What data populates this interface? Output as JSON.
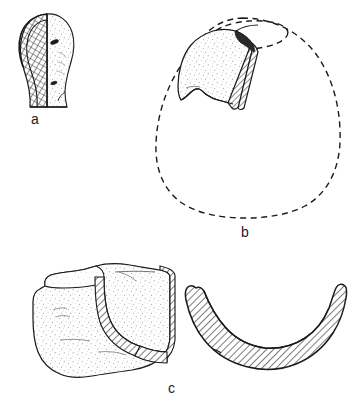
{
  "plate": {
    "title": "Archaeological artefact illustration plate",
    "description": "Ink line drawing plate of three ceramic/stone artefact fragments with sectioned (hatched) profiles, stippled surfaces and dashed reconstruction outlines.",
    "background_color": "#ffffff",
    "ink_color": "#1b1b1b",
    "hatch_color": "#2a2a2a",
    "stipple_color": "#777777"
  },
  "figures": [
    {
      "id": "a",
      "caption": "a",
      "type": "profile-with-section",
      "description": "Small rounded artefact in side view; left half rendered as a cross-hatched section, right half as a stippled outer surface with two small dark perforations.",
      "features": [
        "cross-hatched-section",
        "stippled-surface",
        "two-perforations"
      ],
      "bounds": {
        "x": 18,
        "y": 8,
        "width": 60,
        "height": 100
      }
    },
    {
      "id": "b",
      "caption": "b",
      "type": "rim-sherd-on-reconstructed-vessel",
      "description": "Rim sherd shown in place on a dashed reconstruction outline of an ovoid closed vessel with a circular mouth; sherd break edge is hatched, outer surface stippled.",
      "features": [
        "dashed-reconstruction-outline",
        "elliptical-mouth",
        "hatched-break-edge",
        "stippled-surface"
      ],
      "bounds": {
        "x": 150,
        "y": 12,
        "width": 200,
        "height": 205
      }
    },
    {
      "id": "c",
      "caption": "c",
      "type": "sherd-and-section",
      "description": "Large stippled body sherd at left with hatched broken edge, paired at right with its drawn cross-section profile shown as a solid hatched crescent.",
      "features": [
        "stippled-surface",
        "hatched-edge",
        "hatched-cross-section",
        "crescent-profile"
      ],
      "bounds": {
        "x": 8,
        "y": 258,
        "width": 342,
        "height": 120
      }
    }
  ]
}
